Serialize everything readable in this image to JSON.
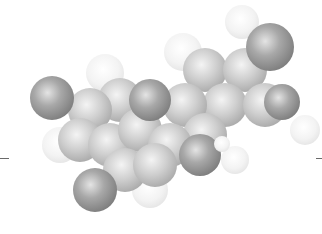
{
  "figure": {
    "type": "space-filling molecular model",
    "style": "grayscale",
    "background": "#ffffff",
    "colors": {
      "heteroatom": "#8c8c8c",
      "carbon": "#bdbdbd",
      "hydrogen": "#f2f2f2"
    }
  },
  "atoms": [
    {
      "kind": "hydrogen",
      "x": 183,
      "y": 52,
      "r": 19
    },
    {
      "kind": "hydrogen",
      "x": 242,
      "y": 22,
      "r": 17
    },
    {
      "kind": "hydrogen",
      "x": 105,
      "y": 73,
      "r": 19
    },
    {
      "kind": "hydrogen",
      "x": 60,
      "y": 145,
      "r": 18
    },
    {
      "kind": "hydrogen",
      "x": 150,
      "y": 190,
      "r": 18
    },
    {
      "kind": "hydrogen",
      "x": 235,
      "y": 160,
      "r": 14
    },
    {
      "kind": "hydrogen",
      "x": 305,
      "y": 130,
      "r": 15
    },
    {
      "kind": "carbon",
      "x": 205,
      "y": 70,
      "r": 22
    },
    {
      "kind": "carbon",
      "x": 245,
      "y": 70,
      "r": 22
    },
    {
      "kind": "carbon",
      "x": 225,
      "y": 105,
      "r": 22
    },
    {
      "kind": "carbon",
      "x": 265,
      "y": 105,
      "r": 22
    },
    {
      "kind": "carbon",
      "x": 185,
      "y": 105,
      "r": 22
    },
    {
      "kind": "carbon",
      "x": 205,
      "y": 135,
      "r": 22
    },
    {
      "kind": "carbon",
      "x": 120,
      "y": 100,
      "r": 22
    },
    {
      "kind": "carbon",
      "x": 90,
      "y": 110,
      "r": 22
    },
    {
      "kind": "carbon",
      "x": 80,
      "y": 140,
      "r": 22
    },
    {
      "kind": "carbon",
      "x": 110,
      "y": 145,
      "r": 22
    },
    {
      "kind": "carbon",
      "x": 140,
      "y": 130,
      "r": 22
    },
    {
      "kind": "carbon",
      "x": 170,
      "y": 145,
      "r": 22
    },
    {
      "kind": "carbon",
      "x": 125,
      "y": 170,
      "r": 22
    },
    {
      "kind": "carbon",
      "x": 155,
      "y": 165,
      "r": 22
    },
    {
      "kind": "heteroatom",
      "x": 52,
      "y": 98,
      "r": 22
    },
    {
      "kind": "heteroatom",
      "x": 150,
      "y": 100,
      "r": 21
    },
    {
      "kind": "heteroatom",
      "x": 282,
      "y": 102,
      "r": 18
    },
    {
      "kind": "heteroatom",
      "x": 270,
      "y": 47,
      "r": 24
    },
    {
      "kind": "heteroatom",
      "x": 95,
      "y": 190,
      "r": 22
    },
    {
      "kind": "heteroatom",
      "x": 200,
      "y": 155,
      "r": 21
    },
    {
      "kind": "hydrogen",
      "x": 222,
      "y": 144,
      "r": 8
    }
  ],
  "ticks": [
    {
      "x": 0,
      "y": 158,
      "w": 9
    },
    {
      "x": 316,
      "y": 158,
      "w": 6
    }
  ]
}
